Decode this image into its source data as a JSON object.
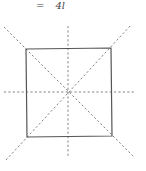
{
  "equation": {
    "sign": "=",
    "rhs": "4l"
  },
  "figure": {
    "shape": "square",
    "square": {
      "corners": {
        "top_left": [
          26,
          49
        ],
        "top_right": [
          111,
          48
        ],
        "bottom_right": [
          112,
          136
        ],
        "bottom_left": [
          27,
          137
        ]
      },
      "stroke": "#555555"
    },
    "symmetry_lines": [
      {
        "name": "diagonal-tl-br",
        "from": [
          4,
          27
        ],
        "to": [
          134,
          157
        ]
      },
      {
        "name": "diagonal-bl-tr",
        "from": [
          6,
          160
        ],
        "to": [
          131,
          25
        ]
      },
      {
        "name": "vertical-axis",
        "from": [
          68,
          26
        ],
        "to": [
          68,
          158
        ]
      },
      {
        "name": "horizontal-axis",
        "from": [
          4,
          92
        ],
        "to": [
          134,
          92
        ]
      }
    ],
    "dash_color": "#777777",
    "center": [
      68,
      92
    ]
  }
}
